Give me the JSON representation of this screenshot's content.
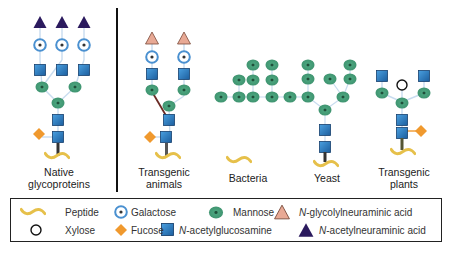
{
  "colors": {
    "neu5ac": "#2b1a5e",
    "neu5gc": "#e8a995",
    "galactose_ring": "#4a90d0",
    "mannose": "#3f9470",
    "glcnac": "#2a78c0",
    "fucose": "#f0992e",
    "peptide": "#e6c04a",
    "linker": "#c8dcef"
  },
  "panels": [
    {
      "id": "native",
      "label_line1": "Native",
      "label_line2": "glycoproteins"
    },
    {
      "id": "animals",
      "label_line1": "Transgenic",
      "label_line2": "animals"
    },
    {
      "id": "bacteria",
      "label_line1": "Bacteria",
      "label_line2": ""
    },
    {
      "id": "yeast",
      "label_line1": "Yeast",
      "label_line2": ""
    },
    {
      "id": "plants",
      "label_line1": "Transgenic",
      "label_line2": "plants"
    }
  ],
  "legend": {
    "peptide": "Peptide",
    "galactose": "Galactose",
    "mannose": "Mannose",
    "neu5gc_prefix": "N",
    "neu5gc_rest": "-glycolylneuraminic acid",
    "xylose": "Xylose",
    "fucose": "Fucose",
    "glcnac_prefix": "N",
    "glcnac_rest": "-acetylglucosamine",
    "neu5ac_prefix": "N",
    "neu5ac_rest": "-acetylneuraminic acid"
  }
}
